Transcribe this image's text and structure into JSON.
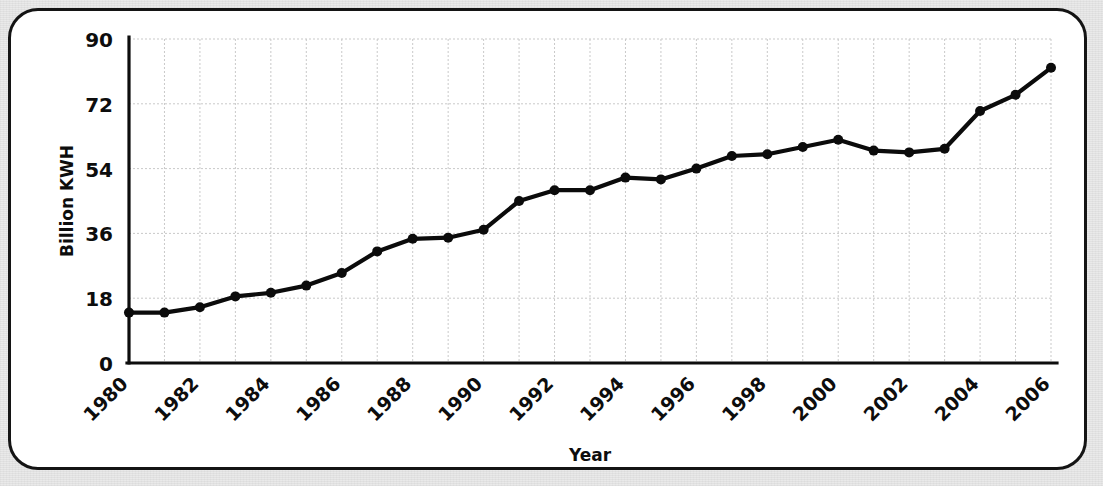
{
  "figure": {
    "frame_color": "#141414",
    "background_color": "#e9e9e9",
    "card_color": "#ffffff"
  },
  "chart_data": {
    "type": "line",
    "title": "",
    "xlabel": "Year",
    "ylabel": "Billion KWH",
    "xlim": [
      1980,
      2006
    ],
    "ylim": [
      0,
      90
    ],
    "yticks": [
      0,
      18,
      36,
      54,
      72,
      90
    ],
    "ytick_labels": [
      "0",
      "18",
      "36",
      "54",
      "72",
      "90"
    ],
    "xticks": [
      1980,
      1982,
      1984,
      1986,
      1988,
      1990,
      1992,
      1994,
      1996,
      1998,
      2000,
      2002,
      2004,
      2006
    ],
    "xtick_labels": [
      "1980",
      "1982",
      "1984",
      "1986",
      "1988",
      "1990",
      "1992",
      "1994",
      "1996",
      "1998",
      "2000",
      "2002",
      "2004",
      "2006"
    ],
    "xtick_rotation": 45,
    "grid": true,
    "legend": null,
    "series_color": "#0b0b0b",
    "marker": "circle",
    "x": [
      1980,
      1981,
      1982,
      1983,
      1984,
      1985,
      1986,
      1987,
      1988,
      1989,
      1990,
      1991,
      1992,
      1993,
      1994,
      1995,
      1996,
      1997,
      1998,
      1999,
      2000,
      2001,
      2002,
      2003,
      2004,
      2005,
      2006
    ],
    "values": [
      14,
      14,
      15.5,
      18.5,
      19.5,
      21.5,
      25,
      31,
      34.5,
      34.8,
      37,
      45,
      48,
      48,
      51.5,
      51,
      54,
      57.5,
      58,
      60,
      62,
      59,
      58.5,
      59.5,
      70,
      74.5,
      82
    ],
    "series": [
      {
        "name": "Billion KWH",
        "values": [
          14,
          14,
          15.5,
          18.5,
          19.5,
          21.5,
          25,
          31,
          34.5,
          34.8,
          37,
          45,
          48,
          48,
          51.5,
          51,
          54,
          57.5,
          58,
          60,
          62,
          59,
          58.5,
          59.5,
          70,
          74.5,
          82
        ]
      }
    ]
  }
}
